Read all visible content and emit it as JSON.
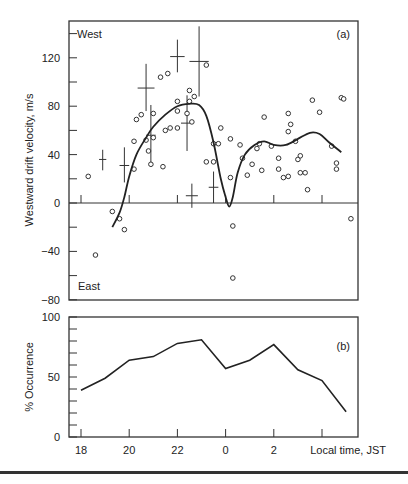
{
  "chart_data": [
    {
      "id": "a",
      "type": "scatter",
      "panel_label": "(a)",
      "title": "",
      "xlabel": "Local time, JST",
      "ylabel": "Westward drift velocity, m/s",
      "annotations": {
        "top": "West",
        "bottom": "East"
      },
      "xlim": [
        17.5,
        29.3
      ],
      "ylim": [
        -80,
        150
      ],
      "x_ticks": [
        18,
        20,
        22,
        24,
        26,
        28
      ],
      "x_tick_labels_hidden": true,
      "y_ticks": [
        120,
        80,
        40,
        0,
        -40,
        -80
      ],
      "y_tick_labels": [
        "120",
        "80",
        "40",
        "0",
        "−40",
        "−80"
      ],
      "y_minor_step": 20,
      "grid": false,
      "zero_line": true,
      "scatter_points": [
        [
          18.3,
          22
        ],
        [
          19.3,
          -7
        ],
        [
          18.6,
          -43
        ],
        [
          19.6,
          -13
        ],
        [
          19.8,
          -22
        ],
        [
          20.2,
          51
        ],
        [
          20.2,
          28
        ],
        [
          20.3,
          69
        ],
        [
          20.5,
          73
        ],
        [
          20.7,
          52
        ],
        [
          20.8,
          43
        ],
        [
          20.9,
          32
        ],
        [
          21.0,
          54
        ],
        [
          21.0,
          74
        ],
        [
          21.3,
          104
        ],
        [
          21.6,
          107
        ],
        [
          21.4,
          30
        ],
        [
          21.5,
          60
        ],
        [
          21.7,
          62
        ],
        [
          22.0,
          84
        ],
        [
          22.0,
          76
        ],
        [
          22.0,
          62
        ],
        [
          22.4,
          74
        ],
        [
          22.5,
          93
        ],
        [
          22.5,
          84
        ],
        [
          22.6,
          67
        ],
        [
          22.7,
          88
        ],
        [
          23.2,
          114
        ],
        [
          23.2,
          34
        ],
        [
          23.5,
          34
        ],
        [
          23.5,
          49
        ],
        [
          23.7,
          49
        ],
        [
          23.8,
          62
        ],
        [
          24.2,
          53
        ],
        [
          24.2,
          21
        ],
        [
          24.3,
          -19
        ],
        [
          24.3,
          -62
        ],
        [
          24.6,
          48
        ],
        [
          24.7,
          37
        ],
        [
          24.9,
          23
        ],
        [
          25.1,
          32
        ],
        [
          25.3,
          45
        ],
        [
          25.4,
          49
        ],
        [
          25.5,
          27
        ],
        [
          25.6,
          71
        ],
        [
          25.9,
          47
        ],
        [
          26.2,
          37
        ],
        [
          26.2,
          28
        ],
        [
          26.4,
          21
        ],
        [
          26.6,
          22
        ],
        [
          26.6,
          74
        ],
        [
          26.6,
          59
        ],
        [
          26.7,
          65
        ],
        [
          26.9,
          51
        ],
        [
          27.0,
          36
        ],
        [
          27.1,
          39
        ],
        [
          27.1,
          25
        ],
        [
          27.3,
          25
        ],
        [
          27.4,
          11
        ],
        [
          27.6,
          85
        ],
        [
          27.9,
          75
        ],
        [
          28.4,
          47
        ],
        [
          28.6,
          33
        ],
        [
          28.6,
          28
        ],
        [
          28.8,
          87
        ],
        [
          28.9,
          86
        ],
        [
          29.2,
          -13
        ]
      ],
      "error_crosses": [
        {
          "x": 18.9,
          "y": 36,
          "x_err": 0.15,
          "y_low": 27,
          "y_high": 44
        },
        {
          "x": 19.8,
          "y": 31,
          "x_err": 0.2,
          "y_low": 17,
          "y_high": 46
        },
        {
          "x": 20.7,
          "y": 95,
          "x_err": 0.35,
          "y_low": 76,
          "y_high": 115
        },
        {
          "x": 20.9,
          "y": 56,
          "x_err": 0.2,
          "y_low": 30,
          "y_high": 81
        },
        {
          "x": 22.0,
          "y": 121,
          "x_err": 0.3,
          "y_low": 108,
          "y_high": 135
        },
        {
          "x": 22.4,
          "y": 66,
          "x_err": 0.25,
          "y_low": 43,
          "y_high": 89
        },
        {
          "x": 22.6,
          "y": 6,
          "x_err": 0.25,
          "y_low": -4,
          "y_high": 16
        },
        {
          "x": 22.9,
          "y": 117,
          "x_err": 0.4,
          "y_low": 88,
          "y_high": 146
        },
        {
          "x": 23.5,
          "y": 13,
          "x_err": 0.2,
          "y_low": 0,
          "y_high": 26
        }
      ],
      "series": [
        {
          "name": "smoothed mean",
          "type": "line",
          "x": [
            19.3,
            19.6,
            19.8,
            20.0,
            20.3,
            20.7,
            21.0,
            21.5,
            22.0,
            22.5,
            22.9,
            23.2,
            23.5,
            23.8,
            24.0,
            24.15,
            24.3,
            24.5,
            24.8,
            25.2,
            25.6,
            26.0,
            26.5,
            27.0,
            27.5,
            27.9,
            28.3,
            28.8
          ],
          "y": [
            -20,
            -8,
            5,
            22,
            40,
            54,
            63,
            73,
            80,
            82,
            81,
            72,
            50,
            20,
            5,
            -3,
            5,
            25,
            40,
            48,
            51,
            48,
            48,
            53,
            58,
            57,
            50,
            42
          ]
        }
      ]
    },
    {
      "id": "b",
      "type": "line",
      "panel_label": "(b)",
      "title": "",
      "xlabel": "Local time, JST",
      "ylabel": "% Occurrence",
      "xlim": [
        17.5,
        29.3
      ],
      "ylim": [
        0,
        100
      ],
      "x_ticks": [
        18,
        20,
        22,
        24,
        26,
        28
      ],
      "x_tick_labels": [
        "18",
        "20",
        "22",
        "0",
        "2",
        ""
      ],
      "y_ticks": [
        0,
        50,
        100
      ],
      "y_tick_labels": [
        "0",
        "50",
        "100"
      ],
      "y_minor_step": 10,
      "grid": false,
      "categories": [
        "18",
        "19",
        "20",
        "21",
        "22",
        "23",
        "0",
        "1",
        "2",
        "3",
        "4",
        "5"
      ],
      "x": [
        18,
        19,
        20,
        21,
        22,
        23,
        24,
        25,
        26,
        27,
        28,
        29
      ],
      "series": [
        {
          "name": "% Occurrence",
          "values": [
            39,
            49,
            64,
            67,
            78,
            81,
            57,
            64,
            77,
            56,
            47,
            21
          ]
        }
      ]
    }
  ],
  "labels": {
    "panel_a": "(a)",
    "panel_b": "(b)",
    "west": "West",
    "east": "East",
    "ylabel_a": "Westward drift velocity, m/s",
    "ylabel_b": "% Occurrence",
    "xlabel": "Local time, JST"
  }
}
